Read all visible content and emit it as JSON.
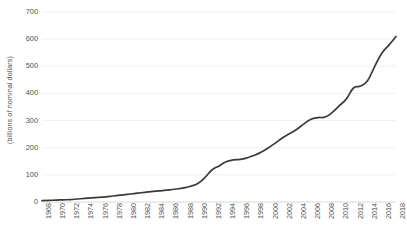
{
  "chart_data": {
    "type": "line",
    "title": "",
    "subtitle": "",
    "xlabel": "",
    "ylabel": "(billions of nominal dollars)",
    "ylim": [
      0,
      700
    ],
    "xlim": [
      1968,
      2018
    ],
    "grid": "horizontal",
    "legend": "none",
    "line_color": "#3a3a38",
    "grid_color": "#f1f1ef",
    "text_color": "#52524f",
    "background": "#ffffff",
    "y_ticks": [
      0,
      100,
      200,
      300,
      400,
      500,
      600,
      700
    ],
    "y_tick_labels": [
      "0",
      "100",
      "200",
      "300",
      "400",
      "500",
      "600",
      "700"
    ],
    "x_tick_labels": [
      "1968",
      "1970",
      "1972",
      "1974",
      "1976",
      "1978",
      "1980",
      "1982",
      "1984",
      "1986",
      "1988",
      "1990",
      "1992",
      "1994",
      "1996",
      "1998",
      "2000",
      "2002",
      "2004",
      "2006",
      "2008",
      "2010",
      "2012",
      "2014",
      "2016",
      "2018"
    ],
    "x": [
      1968,
      1969,
      1970,
      1971,
      1972,
      1973,
      1974,
      1975,
      1976,
      1977,
      1978,
      1979,
      1980,
      1981,
      1982,
      1983,
      1984,
      1985,
      1986,
      1987,
      1988,
      1989,
      1990,
      1991,
      1992,
      1993,
      1994,
      1995,
      1996,
      1997,
      1998,
      1999,
      2000,
      2001,
      2002,
      2003,
      2004,
      2005,
      2006,
      2007,
      2008,
      2009,
      2010,
      2011,
      2012,
      2013,
      2014,
      2015,
      2016,
      2017,
      2018
    ],
    "series": [
      {
        "name": "nominal dollars",
        "values": [
          5,
          6,
          7,
          8,
          9,
          11,
          13,
          15,
          17,
          19,
          22,
          25,
          28,
          31,
          34,
          37,
          40,
          42,
          45,
          48,
          52,
          58,
          68,
          90,
          118,
          133,
          148,
          155,
          157,
          163,
          172,
          184,
          200,
          218,
          237,
          252,
          268,
          288,
          305,
          311,
          313,
          330,
          355,
          380,
          420,
          427,
          448,
          500,
          548,
          578,
          610
        ]
      }
    ]
  }
}
